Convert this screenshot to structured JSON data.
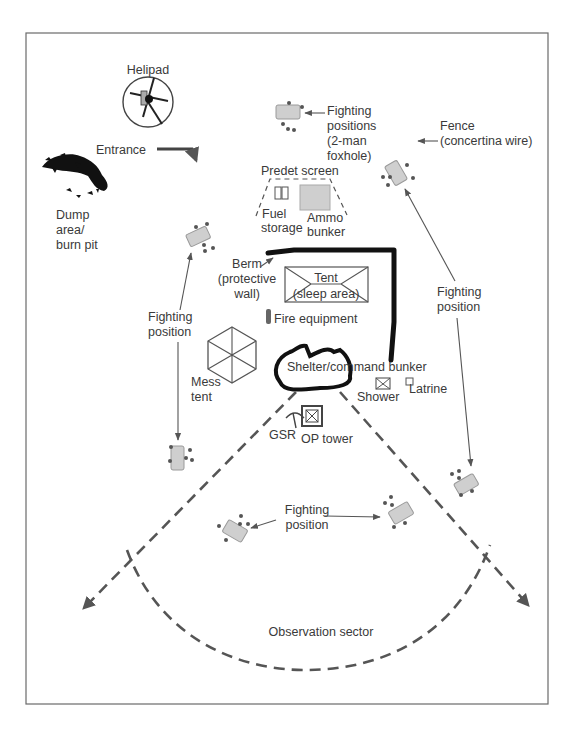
{
  "diagram": {
    "type": "base camp layout",
    "colors": {
      "frame": "#6a6a6a",
      "text": "#3a3a3a",
      "fence": "#2b2b2b",
      "position_fill": "#cfcfcf",
      "dashed": "#555555"
    },
    "labels": {
      "helipad": "Helipad",
      "entrance": "Entrance",
      "dump_1": "Dump",
      "dump_2": "area/",
      "dump_3": "burn pit",
      "fp_top_1": "Fighting",
      "fp_top_2": "positions",
      "fp_top_3": "(2-man",
      "fp_top_4": "foxhole)",
      "fence_1": "Fence",
      "fence_2": "(concertina wire)",
      "predet": "Predet screen",
      "fuel_1": "Fuel",
      "fuel_2": "storage",
      "ammo_1": "Ammo",
      "ammo_2": "bunker",
      "berm_1": "Berm",
      "berm_2": "(protective",
      "berm_3": "wall)",
      "tent_1": "Tent",
      "tent_2": "(sleep area)",
      "fire": "Fire equipment",
      "fp_left_1": "Fighting",
      "fp_left_2": "position",
      "fp_right_1": "Fighting",
      "fp_right_2": "position",
      "mess_1": "Mess",
      "mess_2": "tent",
      "shelter": "Shelter/command bunker",
      "shower": "Shower",
      "latrine": "Latrine",
      "gsr": "GSR",
      "op_tower": "OP tower",
      "fp_bottom_1": "Fighting",
      "fp_bottom_2": "position",
      "observation": "Observation sector"
    }
  }
}
